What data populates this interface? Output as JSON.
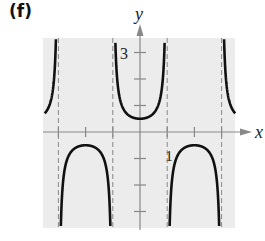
{
  "panel_label": "(f)",
  "chart_data": {
    "type": "line",
    "title": "",
    "function": "y = 0.5 * sec(pi*x/2)",
    "xlabel": "x",
    "ylabel": "y",
    "xlim": [
      -3.5,
      3.5
    ],
    "ylim": [
      -3.5,
      3.5
    ],
    "grid": false,
    "x_ticks": [
      -3,
      -2,
      -1,
      1,
      2,
      3
    ],
    "y_ticks": [
      -3,
      -2,
      -1,
      1,
      2,
      3
    ],
    "tick_labels": {
      "x": [
        "1"
      ],
      "y": [
        "3"
      ]
    },
    "asymptotes": [
      -3,
      -1,
      1,
      3
    ],
    "series": [
      {
        "name": "branch-left-upper",
        "x_range": [
          -3.5,
          -3
        ],
        "points": [
          [
            -3.5,
            0.71
          ],
          [
            -3.2,
            1.6
          ],
          [
            -3.05,
            6.4
          ]
        ]
      },
      {
        "name": "branch-left-lower",
        "x_range": [
          -3,
          -1
        ],
        "points": [
          [
            -2.9,
            -3.19
          ],
          [
            -2.5,
            -0.71
          ],
          [
            -2,
            -0.5
          ],
          [
            -1.5,
            -0.71
          ],
          [
            -1.1,
            -3.19
          ]
        ]
      },
      {
        "name": "branch-center-upper",
        "x_range": [
          -1,
          1
        ],
        "points": [
          [
            -0.9,
            3.19
          ],
          [
            -0.5,
            0.71
          ],
          [
            0,
            0.5
          ],
          [
            0.5,
            0.71
          ],
          [
            0.9,
            3.19
          ]
        ]
      },
      {
        "name": "branch-right-lower",
        "x_range": [
          1,
          3
        ],
        "points": [
          [
            1.1,
            -3.19
          ],
          [
            1.5,
            -0.71
          ],
          [
            2,
            -0.5
          ],
          [
            2.5,
            -0.71
          ],
          [
            2.9,
            -3.19
          ]
        ]
      },
      {
        "name": "branch-right-upper",
        "x_range": [
          3,
          3.5
        ],
        "points": [
          [
            3.05,
            6.4
          ],
          [
            3.2,
            1.6
          ],
          [
            3.5,
            0.71
          ]
        ]
      }
    ]
  }
}
